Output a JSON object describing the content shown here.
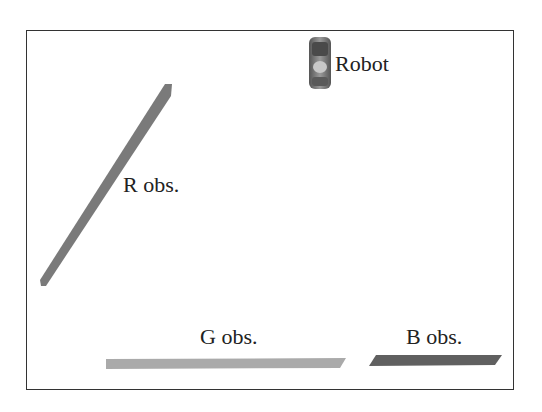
{
  "scene": {
    "robot": {
      "label": "Robot",
      "color": "#6a6a6a"
    },
    "obstacles": [
      {
        "id": "R",
        "label": "R obs.",
        "color": "#7a7a7a"
      },
      {
        "id": "G",
        "label": "G obs.",
        "color": "#a8a8a8"
      },
      {
        "id": "B",
        "label": "B obs.",
        "color": "#5e5e5e"
      }
    ]
  }
}
